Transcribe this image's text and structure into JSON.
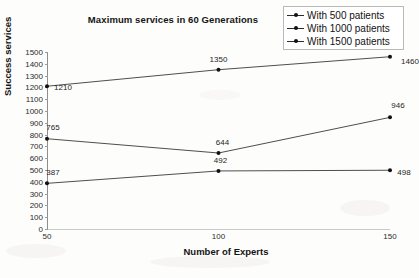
{
  "chart_data": {
    "type": "line",
    "title": "Maximum services in 60 Generations",
    "xlabel": "Number of Experts",
    "ylabel": "Success services",
    "x": [
      50,
      100,
      150
    ],
    "xtick_labels": [
      "50",
      "100",
      "150"
    ],
    "ytick_labels": [
      "0",
      "100",
      "200",
      "300",
      "400",
      "500",
      "600",
      "700",
      "800",
      "900",
      "1000",
      "1100",
      "1200",
      "1300",
      "1400",
      "1500"
    ],
    "ylim": [
      0,
      1500
    ],
    "xlim": [
      50,
      150
    ],
    "grid": false,
    "legend_position": "top-right",
    "series": [
      {
        "name": "With 500 patients",
        "values": [
          387,
          492,
          498
        ],
        "labels": [
          "387",
          "492",
          "498"
        ]
      },
      {
        "name": "With 1000 patients",
        "values": [
          765,
          644,
          946
        ],
        "labels": [
          "765",
          "644",
          "946"
        ]
      },
      {
        "name": "With 1500 patients",
        "values": [
          1210,
          1350,
          1460
        ],
        "labels": [
          "1210",
          "1350",
          "1460"
        ]
      }
    ]
  },
  "legend": {
    "items": [
      {
        "label": "With 500 patients"
      },
      {
        "label": "With 1000 patients"
      },
      {
        "label": "With 1500 patients"
      }
    ]
  }
}
